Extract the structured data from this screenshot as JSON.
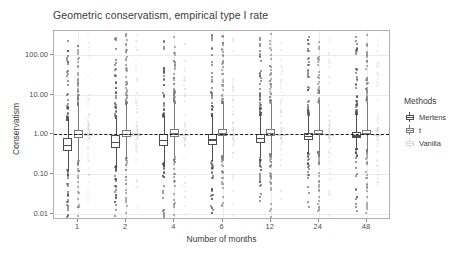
{
  "chart_data": {
    "type": "boxplot",
    "title": "Geometric conservatism, empirical type I rate",
    "xlabel": "Number of months",
    "ylabel": "Conservatism",
    "yscale": "log10",
    "ylim": [
      0.007,
      400
    ],
    "grid": true,
    "legend_position": "right",
    "legend_title": "Methods",
    "reference_line": {
      "y": 1.0,
      "style": "dashed",
      "color": "#1c1c1c"
    },
    "categories": [
      "1",
      "2",
      "4",
      "6",
      "12",
      "24",
      "48"
    ],
    "ytick_labels": [
      "100.00",
      "10.00",
      "1.00",
      "0.10",
      "0.01"
    ],
    "ytick_values": [
      100,
      10,
      1,
      0.1,
      0.01
    ],
    "series": [
      {
        "name": "Mertens",
        "color": "#4d4d4d",
        "boxes": [
          {
            "category": "1",
            "q1": 0.38,
            "median": 0.55,
            "q3": 0.82,
            "lower": 0.13,
            "upper": 2.3
          },
          {
            "category": "2",
            "q1": 0.46,
            "median": 0.66,
            "q3": 0.95,
            "lower": 0.16,
            "upper": 2.6
          },
          {
            "category": "4",
            "q1": 0.52,
            "median": 0.72,
            "q3": 1.0,
            "lower": 0.19,
            "upper": 2.8
          },
          {
            "category": "6",
            "q1": 0.55,
            "median": 0.75,
            "q3": 1.02,
            "lower": 0.21,
            "upper": 2.9
          },
          {
            "category": "12",
            "q1": 0.62,
            "median": 0.82,
            "q3": 1.05,
            "lower": 0.26,
            "upper": 3.0
          },
          {
            "category": "24",
            "q1": 0.72,
            "median": 0.9,
            "q3": 1.1,
            "lower": 0.34,
            "upper": 3.1
          },
          {
            "category": "48",
            "q1": 0.8,
            "median": 0.95,
            "q3": 1.12,
            "lower": 0.42,
            "upper": 3.2
          }
        ]
      },
      {
        "name": "t",
        "color": "#7a7a7a",
        "boxes": [
          {
            "category": "1",
            "q1": 0.82,
            "median": 1.02,
            "q3": 1.3,
            "lower": 0.22,
            "upper": 5.5
          },
          {
            "category": "2",
            "q1": 0.86,
            "median": 1.05,
            "q3": 1.32,
            "lower": 0.25,
            "upper": 5.8
          },
          {
            "category": "4",
            "q1": 0.88,
            "median": 1.06,
            "q3": 1.33,
            "lower": 0.27,
            "upper": 6.0
          },
          {
            "category": "6",
            "q1": 0.9,
            "median": 1.07,
            "q3": 1.34,
            "lower": 0.29,
            "upper": 6.1
          },
          {
            "category": "12",
            "q1": 0.92,
            "median": 1.08,
            "q3": 1.33,
            "lower": 0.32,
            "upper": 6.2
          },
          {
            "category": "24",
            "q1": 0.94,
            "median": 1.08,
            "q3": 1.3,
            "lower": 0.36,
            "upper": 6.3
          },
          {
            "category": "48",
            "q1": 0.95,
            "median": 1.07,
            "q3": 1.26,
            "lower": 0.4,
            "upper": 6.4
          }
        ]
      },
      {
        "name": "Vanilla",
        "color": "#d9d9d9",
        "boxes": [
          {
            "category": "1",
            "q1": 0.95,
            "median": 1.0,
            "q3": 1.06,
            "lower": 0.78,
            "upper": 1.3
          },
          {
            "category": "2",
            "q1": 0.95,
            "median": 1.0,
            "q3": 1.06,
            "lower": 0.78,
            "upper": 1.3
          },
          {
            "category": "4",
            "q1": 0.96,
            "median": 1.0,
            "q3": 1.05,
            "lower": 0.8,
            "upper": 1.28
          },
          {
            "category": "6",
            "q1": 0.96,
            "median": 1.0,
            "q3": 1.05,
            "lower": 0.81,
            "upper": 1.26
          },
          {
            "category": "12",
            "q1": 0.96,
            "median": 1.0,
            "q3": 1.04,
            "lower": 0.83,
            "upper": 1.24
          },
          {
            "category": "24",
            "q1": 0.97,
            "median": 1.0,
            "q3": 1.04,
            "lower": 0.85,
            "upper": 1.22
          },
          {
            "category": "48",
            "q1": 0.97,
            "median": 1.0,
            "q3": 1.03,
            "lower": 0.87,
            "upper": 1.2
          }
        ]
      }
    ]
  },
  "legend": {
    "title": "Methods",
    "items": [
      {
        "label": "Mertens",
        "color": "#4d4d4d"
      },
      {
        "label": "t",
        "color": "#7a7a7a"
      },
      {
        "label": "Vanilla",
        "color": "#d9d9d9"
      }
    ]
  }
}
